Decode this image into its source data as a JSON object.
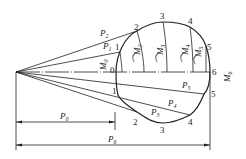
{
  "diagram": {
    "type": "force-polygon-cam-profile",
    "colors": {
      "stroke": "#222222",
      "background": "#ffffff"
    },
    "upper_points": [
      {
        "id": "0",
        "label": "0"
      },
      {
        "id": "1",
        "label": "1"
      },
      {
        "id": "2",
        "label": "2"
      },
      {
        "id": "3",
        "label": "3"
      },
      {
        "id": "4",
        "label": "4"
      },
      {
        "id": "5",
        "label": "5"
      },
      {
        "id": "6",
        "label": "6"
      }
    ],
    "lower_points": [
      {
        "id": "1",
        "label": "1"
      },
      {
        "id": "2",
        "label": "2"
      },
      {
        "id": "3",
        "label": "3"
      },
      {
        "id": "4",
        "label": "4"
      },
      {
        "id": "5",
        "label": "5"
      }
    ],
    "forces": {
      "P1": {
        "base": "P",
        "sub": "1"
      },
      "P2": {
        "base": "P",
        "sub": "2"
      },
      "P3": {
        "base": "P",
        "sub": "3"
      },
      "P4": {
        "base": "P",
        "sub": "4"
      },
      "P5": {
        "base": "P",
        "sub": "5"
      }
    },
    "moments": {
      "M0": {
        "base": "M",
        "sub": "0"
      },
      "M2": {
        "base": "M",
        "sub": "2"
      },
      "M3": {
        "base": "M",
        "sub": "3"
      },
      "M4": {
        "base": "M",
        "sub": "4"
      },
      "M5": {
        "base": "M",
        "sub": "5"
      },
      "M6": {
        "base": "M",
        "sub": "6"
      }
    },
    "dimensions": {
      "P0": {
        "base": "P",
        "sub": "0"
      },
      "P6": {
        "base": "P",
        "sub": "6"
      }
    }
  }
}
